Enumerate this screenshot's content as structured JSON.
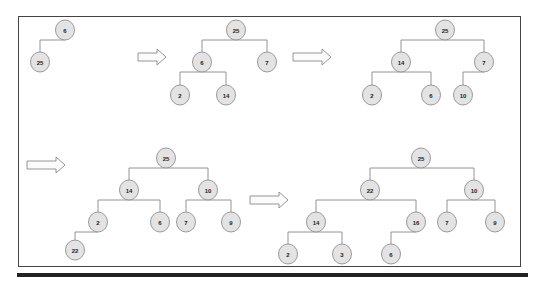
{
  "colors": {
    "node_fill": "#e3e3e3",
    "node_stroke": "#9a9a9a",
    "edge": "#888888",
    "frame": "#444444",
    "bar": "#222222"
  },
  "trees": [
    {
      "id": "step-1",
      "nodes": [
        {
          "id": "a",
          "label": "6",
          "x": 65,
          "y": 30
        },
        {
          "id": "b",
          "label": "25",
          "x": 40,
          "y": 62
        }
      ],
      "edges": [
        [
          "a",
          "b"
        ]
      ]
    },
    {
      "id": "step-2",
      "nodes": [
        {
          "id": "a",
          "label": "25",
          "x": 236,
          "y": 30
        },
        {
          "id": "b",
          "label": "6",
          "x": 202,
          "y": 62
        },
        {
          "id": "c",
          "label": "7",
          "x": 267,
          "y": 62
        },
        {
          "id": "d",
          "label": "2",
          "x": 180,
          "y": 95
        },
        {
          "id": "e",
          "label": "14",
          "x": 226,
          "y": 95
        }
      ],
      "edges": [
        [
          "a",
          "b"
        ],
        [
          "a",
          "c"
        ],
        [
          "b",
          "d"
        ],
        [
          "b",
          "e"
        ]
      ]
    },
    {
      "id": "step-3",
      "nodes": [
        {
          "id": "a",
          "label": "25",
          "x": 445,
          "y": 30
        },
        {
          "id": "b",
          "label": "14",
          "x": 401,
          "y": 62
        },
        {
          "id": "c",
          "label": "7",
          "x": 484,
          "y": 62
        },
        {
          "id": "d",
          "label": "2",
          "x": 372,
          "y": 95
        },
        {
          "id": "e",
          "label": "6",
          "x": 431,
          "y": 95
        },
        {
          "id": "f",
          "label": "10",
          "x": 463,
          "y": 95
        }
      ],
      "edges": [
        [
          "a",
          "b"
        ],
        [
          "a",
          "c"
        ],
        [
          "b",
          "d"
        ],
        [
          "b",
          "e"
        ],
        [
          "c",
          "f"
        ]
      ]
    },
    {
      "id": "step-4",
      "nodes": [
        {
          "id": "a",
          "label": "25",
          "x": 166,
          "y": 158
        },
        {
          "id": "b",
          "label": "14",
          "x": 129,
          "y": 190
        },
        {
          "id": "c",
          "label": "10",
          "x": 208,
          "y": 190
        },
        {
          "id": "d",
          "label": "2",
          "x": 98,
          "y": 222
        },
        {
          "id": "e",
          "label": "6",
          "x": 160,
          "y": 222
        },
        {
          "id": "f",
          "label": "7",
          "x": 186,
          "y": 222
        },
        {
          "id": "g",
          "label": "9",
          "x": 231,
          "y": 222
        },
        {
          "id": "h",
          "label": "22",
          "x": 75,
          "y": 250
        }
      ],
      "edges": [
        [
          "a",
          "b"
        ],
        [
          "a",
          "c"
        ],
        [
          "b",
          "d"
        ],
        [
          "b",
          "e"
        ],
        [
          "c",
          "f"
        ],
        [
          "c",
          "g"
        ],
        [
          "d",
          "h"
        ]
      ]
    },
    {
      "id": "step-5",
      "nodes": [
        {
          "id": "a",
          "label": "25",
          "x": 421,
          "y": 158
        },
        {
          "id": "b",
          "label": "22",
          "x": 370,
          "y": 190
        },
        {
          "id": "c",
          "label": "10",
          "x": 474,
          "y": 190
        },
        {
          "id": "d",
          "label": "14",
          "x": 316,
          "y": 222
        },
        {
          "id": "e",
          "label": "16",
          "x": 416,
          "y": 222
        },
        {
          "id": "f",
          "label": "7",
          "x": 447,
          "y": 222
        },
        {
          "id": "g",
          "label": "9",
          "x": 495,
          "y": 222
        },
        {
          "id": "h",
          "label": "2",
          "x": 288,
          "y": 254
        },
        {
          "id": "i",
          "label": "3",
          "x": 342,
          "y": 254
        },
        {
          "id": "j",
          "label": "6",
          "x": 391,
          "y": 254
        }
      ],
      "edges": [
        [
          "a",
          "b"
        ],
        [
          "a",
          "c"
        ],
        [
          "b",
          "d"
        ],
        [
          "b",
          "e"
        ],
        [
          "c",
          "f"
        ],
        [
          "c",
          "g"
        ],
        [
          "d",
          "h"
        ],
        [
          "d",
          "i"
        ],
        [
          "e",
          "j"
        ]
      ]
    }
  ],
  "arrows": [
    {
      "x": 138,
      "y": 57,
      "w": 28
    },
    {
      "x": 293,
      "y": 57,
      "w": 38
    },
    {
      "x": 27,
      "y": 165,
      "w": 38
    },
    {
      "x": 250,
      "y": 200,
      "w": 38
    }
  ]
}
